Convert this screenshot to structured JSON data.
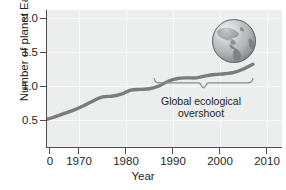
{
  "figure": {
    "background_color": "#ffffff",
    "plot_background_color": "#eceded",
    "axis_color": "#4c4c4c",
    "grid_color": "#f8f9f9",
    "line_color": "#7c7c7c"
  },
  "axes": {
    "ylabel": "Number of planet Earths",
    "xlabel": "Year",
    "yticks": [
      {
        "value": 2.0,
        "label": "2.0",
        "py": 18
      },
      {
        "value": 1.5,
        "label": "1.5",
        "py": 52
      },
      {
        "value": 1.0,
        "label": "1.0",
        "py": 86
      },
      {
        "value": 0.5,
        "label": "0.5",
        "py": 120
      }
    ],
    "xticks": [
      {
        "value": 0,
        "label": "0",
        "px": 49
      },
      {
        "value": 1970,
        "label": "1970",
        "px": 78
      },
      {
        "value": 1980,
        "label": "1980",
        "px": 125
      },
      {
        "value": 1990,
        "label": "1990",
        "px": 172
      },
      {
        "value": 2000,
        "label": "2000",
        "px": 219
      },
      {
        "value": 2010,
        "label": "2010",
        "px": 266
      }
    ]
  },
  "annotation": {
    "line1": "Global ecological",
    "line2": "overshoot",
    "full_text": "Global ecological overshoot",
    "brace_start_year": 1986,
    "brace_end_year": 2007
  },
  "globe": {
    "icon_name": "earth-globe-americas",
    "center_px": [
      234,
      41
    ],
    "radius_px": 23
  },
  "chart_data": {
    "type": "line",
    "title": "",
    "xlabel": "Year",
    "ylabel": "Number of planet Earths",
    "xlim": [
      1961,
      2012
    ],
    "ylim": [
      0.23,
      2.15
    ],
    "xticks": [
      0,
      1970,
      1980,
      1990,
      2000,
      2010
    ],
    "xtick_labels": [
      "0",
      "1970",
      "1980",
      "1990",
      "2000",
      "2010"
    ],
    "yticks": [
      0.5,
      1.0,
      1.5,
      2.0
    ],
    "ytick_labels": [
      "0.5",
      "1.0",
      "1.5",
      "2.0"
    ],
    "grid": true,
    "legend": null,
    "series": [
      {
        "name": "Humanity's Ecological Footprint",
        "x": [
          1961,
          1963,
          1965,
          1967,
          1969,
          1971,
          1973,
          1975,
          1977,
          1979,
          1981,
          1983,
          1985,
          1987,
          1989,
          1991,
          1993,
          1995,
          1997,
          1999,
          2001,
          2003,
          2005,
          2007
        ],
        "values": [
          0.5,
          0.51,
          0.55,
          0.6,
          0.65,
          0.71,
          0.78,
          0.84,
          0.85,
          0.88,
          0.94,
          0.95,
          0.96,
          1.0,
          1.07,
          1.11,
          1.12,
          1.12,
          1.15,
          1.17,
          1.18,
          1.2,
          1.25,
          1.32
        ]
      }
    ],
    "annotations": [
      {
        "text": "Global ecological overshoot",
        "type": "brace",
        "x_range": [
          1986,
          2007
        ],
        "y": 1.0
      }
    ]
  }
}
